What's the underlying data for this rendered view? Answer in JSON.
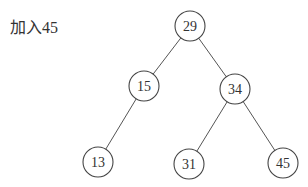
{
  "caption": "加入45",
  "tree": {
    "nodes": [
      {
        "id": "n29",
        "value": "29",
        "cx": 190,
        "cy": 26
      },
      {
        "id": "n15",
        "value": "15",
        "cx": 144,
        "cy": 86
      },
      {
        "id": "n34",
        "value": "34",
        "cx": 235,
        "cy": 89
      },
      {
        "id": "n13",
        "value": "13",
        "cx": 98,
        "cy": 162
      },
      {
        "id": "n31",
        "value": "31",
        "cx": 189,
        "cy": 164
      },
      {
        "id": "n45",
        "value": "45",
        "cx": 283,
        "cy": 163
      }
    ],
    "edges": [
      {
        "from": "n29",
        "to": "n15"
      },
      {
        "from": "n29",
        "to": "n34"
      },
      {
        "from": "n15",
        "to": "n13"
      },
      {
        "from": "n34",
        "to": "n31"
      },
      {
        "from": "n34",
        "to": "n45"
      }
    ],
    "radius": 15
  }
}
